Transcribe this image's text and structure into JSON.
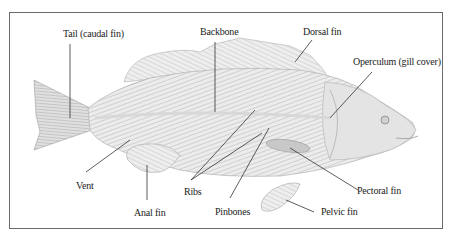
{
  "diagram": {
    "labels": {
      "tail": "Tail (caudal fin)",
      "backbone": "Backbone",
      "dorsal_fin": "Dorsal fin",
      "operculum": "Operculum (gill cover)",
      "vent": "Vent",
      "anal_fin": "Anal fin",
      "ribs": "Ribs",
      "pinbones": "Pinbones",
      "pectoral_fin": "Pectoral fin",
      "pelvic_fin": "Pelvic fin"
    },
    "colors": {
      "frame": "#6a6a6a",
      "leader_lines": "#333333",
      "fish_fill": "#e6e6e6",
      "fish_stroke": "#9a9a9a"
    }
  }
}
